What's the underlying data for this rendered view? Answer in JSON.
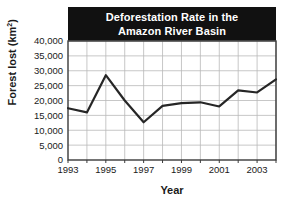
{
  "chart_data": {
    "type": "line",
    "title": "Deforestation Rate in the Amazon River Basin",
    "title_lines": [
      "Deforestation Rate in the",
      "Amazon River Basin"
    ],
    "xlabel": "Year",
    "ylabel": "Forest lost (km²)",
    "ylabel_main": "Forest lost (km",
    "ylabel_sup": "2",
    "ylabel_close": ")",
    "x": [
      1993,
      1994,
      1995,
      1996,
      1997,
      1998,
      1999,
      2000,
      2001,
      2002,
      2003,
      2004
    ],
    "values": [
      17400,
      16000,
      28500,
      20000,
      12700,
      18200,
      19100,
      19400,
      18000,
      23400,
      22700,
      27100
    ],
    "xlim": [
      1993,
      2004
    ],
    "ylim": [
      0,
      40000
    ],
    "yticks": [
      0,
      5000,
      10000,
      15000,
      20000,
      25000,
      30000,
      35000,
      40000
    ],
    "ytick_labels": [
      "0",
      "5,000",
      "10,000",
      "15,000",
      "20,000",
      "25,000",
      "30,000",
      "35,000",
      "40,000"
    ],
    "xticks": [
      1993,
      1995,
      1997,
      1999,
      2001,
      2003
    ],
    "xtick_labels": [
      "1993",
      "1995",
      "1997",
      "1999",
      "2001",
      "2003"
    ],
    "grid": true,
    "legend": false,
    "line_color": "#262626",
    "grid_color": "#b9b9b9",
    "axis_color": "#3a3a3a",
    "title_bg_color": "#111111",
    "title_text_color": "#ffffff",
    "plot_bg_color": "#ffffff"
  }
}
